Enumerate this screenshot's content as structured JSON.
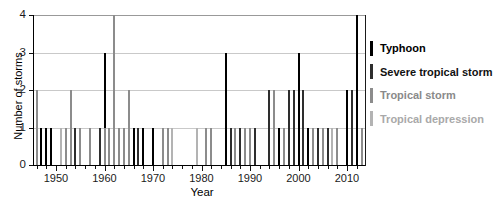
{
  "chart_data": {
    "type": "bar",
    "title": "",
    "xlabel": "Year",
    "ylabel": "Number of storms",
    "xlim": [
      1945,
      2014
    ],
    "ylim": [
      0,
      4
    ],
    "xticks": [
      1950,
      1960,
      1970,
      1980,
      1990,
      2000,
      2010
    ],
    "yticks": [
      0,
      1,
      2,
      3,
      4
    ],
    "grid": "horizontal light-gray lines at y=1,2,3,4",
    "legend_position": "right of plot",
    "bar_style": "thin vertical stacked bars, one per year",
    "category_codes": {
      "TY": "Typhoon",
      "STS": "Severe tropical storm",
      "TS": "Tropical storm",
      "TD": "Tropical depression"
    },
    "category_colors": {
      "TY": "#000000",
      "STS": "#2e2e2e",
      "TS": "#8c8c8c",
      "TD": "#b3b3b3"
    },
    "legend": [
      {
        "label": "Typhoon",
        "color": "#000000",
        "text_color": "#000000"
      },
      {
        "label": "Severe tropical storm",
        "color": "#2e2e2e",
        "text_color": "#111111"
      },
      {
        "label": "Tropical storm",
        "color": "#8c8c8c",
        "text_color": "#8a8a8a"
      },
      {
        "label": "Tropical depression",
        "color": "#b3b3b3",
        "text_color": "#a9a9a9"
      }
    ],
    "bars": [
      {
        "year": 1946,
        "stack": [
          {
            "code": "TS",
            "count": 2
          }
        ]
      },
      {
        "year": 1947,
        "stack": [
          {
            "code": "TY",
            "count": 1
          }
        ]
      },
      {
        "year": 1948,
        "stack": [
          {
            "code": "TY",
            "count": 1
          }
        ]
      },
      {
        "year": 1949,
        "stack": [
          {
            "code": "TY",
            "count": 1
          }
        ]
      },
      {
        "year": 1951,
        "stack": [
          {
            "code": "TD",
            "count": 1
          }
        ]
      },
      {
        "year": 1952,
        "stack": [
          {
            "code": "TS",
            "count": 1
          }
        ]
      },
      {
        "year": 1953,
        "stack": [
          {
            "code": "TS",
            "count": 2
          }
        ]
      },
      {
        "year": 1954,
        "stack": [
          {
            "code": "STS",
            "count": 1
          }
        ]
      },
      {
        "year": 1955,
        "stack": [
          {
            "code": "TS",
            "count": 1
          }
        ]
      },
      {
        "year": 1957,
        "stack": [
          {
            "code": "TS",
            "count": 1
          }
        ]
      },
      {
        "year": 1959,
        "stack": [
          {
            "code": "STS",
            "count": 1
          }
        ]
      },
      {
        "year": 1960,
        "stack": [
          {
            "code": "TS",
            "count": 1
          },
          {
            "code": "TY",
            "count": 2
          }
        ]
      },
      {
        "year": 1961,
        "stack": [
          {
            "code": "TS",
            "count": 1
          }
        ]
      },
      {
        "year": 1962,
        "stack": [
          {
            "code": "TS",
            "count": 4
          }
        ]
      },
      {
        "year": 1963,
        "stack": [
          {
            "code": "TS",
            "count": 1
          }
        ]
      },
      {
        "year": 1964,
        "stack": [
          {
            "code": "TS",
            "count": 1
          }
        ]
      },
      {
        "year": 1965,
        "stack": [
          {
            "code": "TS",
            "count": 2
          }
        ]
      },
      {
        "year": 1966,
        "stack": [
          {
            "code": "TY",
            "count": 1
          }
        ]
      },
      {
        "year": 1967,
        "stack": [
          {
            "code": "STS",
            "count": 1
          }
        ]
      },
      {
        "year": 1968,
        "stack": [
          {
            "code": "TY",
            "count": 1
          }
        ]
      },
      {
        "year": 1970,
        "stack": [
          {
            "code": "TY",
            "count": 1
          }
        ]
      },
      {
        "year": 1972,
        "stack": [
          {
            "code": "TS",
            "count": 1
          }
        ]
      },
      {
        "year": 1973,
        "stack": [
          {
            "code": "TS",
            "count": 1
          }
        ]
      },
      {
        "year": 1974,
        "stack": [
          {
            "code": "TD",
            "count": 1
          }
        ]
      },
      {
        "year": 1979,
        "stack": [
          {
            "code": "TD",
            "count": 1
          }
        ]
      },
      {
        "year": 1981,
        "stack": [
          {
            "code": "TS",
            "count": 1
          }
        ]
      },
      {
        "year": 1982,
        "stack": [
          {
            "code": "TS",
            "count": 1
          }
        ]
      },
      {
        "year": 1985,
        "stack": [
          {
            "code": "TY",
            "count": 3
          }
        ]
      },
      {
        "year": 1986,
        "stack": [
          {
            "code": "STS",
            "count": 1
          }
        ]
      },
      {
        "year": 1987,
        "stack": [
          {
            "code": "TS",
            "count": 1
          }
        ]
      },
      {
        "year": 1988,
        "stack": [
          {
            "code": "STS",
            "count": 1
          }
        ]
      },
      {
        "year": 1989,
        "stack": [
          {
            "code": "TS",
            "count": 1
          }
        ]
      },
      {
        "year": 1990,
        "stack": [
          {
            "code": "TS",
            "count": 1
          }
        ]
      },
      {
        "year": 1991,
        "stack": [
          {
            "code": "STS",
            "count": 1
          }
        ]
      },
      {
        "year": 1994,
        "stack": [
          {
            "code": "STS",
            "count": 2
          }
        ]
      },
      {
        "year": 1995,
        "stack": [
          {
            "code": "TS",
            "count": 2
          }
        ]
      },
      {
        "year": 1996,
        "stack": [
          {
            "code": "TY",
            "count": 1
          }
        ]
      },
      {
        "year": 1997,
        "stack": [
          {
            "code": "TS",
            "count": 1
          }
        ]
      },
      {
        "year": 1998,
        "stack": [
          {
            "code": "STS",
            "count": 2
          }
        ]
      },
      {
        "year": 1999,
        "stack": [
          {
            "code": "STS",
            "count": 2
          }
        ]
      },
      {
        "year": 2000,
        "stack": [
          {
            "code": "TY",
            "count": 3
          }
        ]
      },
      {
        "year": 2001,
        "stack": [
          {
            "code": "STS",
            "count": 2
          }
        ]
      },
      {
        "year": 2002,
        "stack": [
          {
            "code": "TY",
            "count": 1
          }
        ]
      },
      {
        "year": 2003,
        "stack": [
          {
            "code": "TS",
            "count": 1
          }
        ]
      },
      {
        "year": 2004,
        "stack": [
          {
            "code": "STS",
            "count": 1
          }
        ]
      },
      {
        "year": 2005,
        "stack": [
          {
            "code": "TS",
            "count": 1
          }
        ]
      },
      {
        "year": 2006,
        "stack": [
          {
            "code": "STS",
            "count": 1
          }
        ]
      },
      {
        "year": 2007,
        "stack": [
          {
            "code": "TD",
            "count": 1
          }
        ]
      },
      {
        "year": 2008,
        "stack": [
          {
            "code": "TS",
            "count": 1
          }
        ]
      },
      {
        "year": 2010,
        "stack": [
          {
            "code": "TY",
            "count": 2
          }
        ]
      },
      {
        "year": 2011,
        "stack": [
          {
            "code": "STS",
            "count": 2
          }
        ]
      },
      {
        "year": 2012,
        "stack": [
          {
            "code": "TY",
            "count": 4
          }
        ]
      },
      {
        "year": 2013,
        "stack": [
          {
            "code": "TS",
            "count": 1
          }
        ]
      }
    ]
  }
}
